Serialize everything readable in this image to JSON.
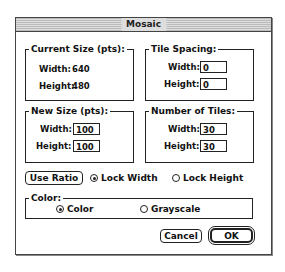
{
  "window": {
    "title": "Mosaic"
  },
  "current_size": {
    "label": "Current Size (pts):",
    "width_label": "Width:",
    "width_value": "640",
    "height_label": "Height:",
    "height_value": "480"
  },
  "tile_spacing": {
    "label": "Tile Spacing:",
    "width_label": "Width:",
    "width_value": "0",
    "height_label": "Height:",
    "height_value": "0"
  },
  "new_size": {
    "label": "New Size (pts):",
    "width_label": "Width:",
    "width_value": "100",
    "height_label": "Height:",
    "height_value": "100"
  },
  "number_of_tiles": {
    "label": "Number of Tiles:",
    "width_label": "Width:",
    "width_value": "30",
    "height_label": "Height:",
    "height_value": "30"
  },
  "ratio": {
    "use_ratio_label": "Use Ratio",
    "lock_width_label": "Lock Width",
    "lock_height_label": "Lock Height",
    "selected": "Lock Width"
  },
  "color": {
    "label": "Color:",
    "color_option": "Color",
    "grayscale_option": "Grayscale",
    "selected": "Color"
  },
  "buttons": {
    "cancel": "Cancel",
    "ok": "OK"
  }
}
